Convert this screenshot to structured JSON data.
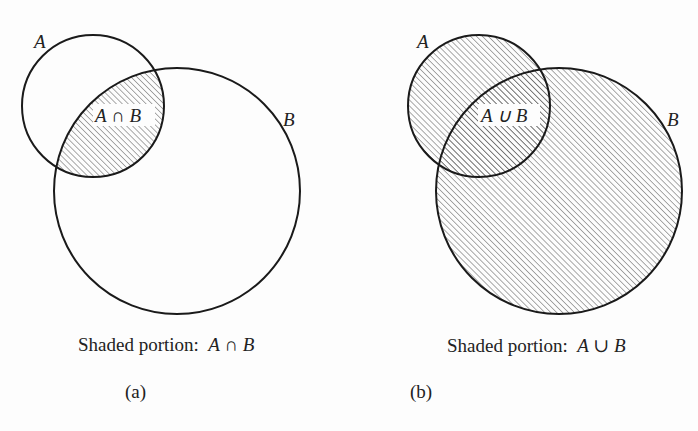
{
  "panels": [
    {
      "id": "a",
      "label": "(a)",
      "caption_text": "Shaded portion:",
      "caption_math": "A ∩ B",
      "set_a_label": "A",
      "set_b_label": "B",
      "region_label": "A ∩ B",
      "shaded_region": "intersection",
      "circle_a": {
        "cx": 93,
        "cy": 106,
        "r": 71
      },
      "circle_b": {
        "cx": 177,
        "cy": 191,
        "r": 123
      }
    },
    {
      "id": "b",
      "label": "(b)",
      "caption_text": "Shaded portion:",
      "caption_math": "A ∪ B",
      "set_a_label": "A",
      "set_b_label": "B",
      "region_label": "A ∪ B",
      "shaded_region": "union",
      "circle_a": {
        "cx": 479,
        "cy": 106,
        "r": 71
      },
      "circle_b": {
        "cx": 559,
        "cy": 191,
        "r": 123
      }
    }
  ],
  "colors": {
    "stroke": "#1a1a1a",
    "hatch": "#555555",
    "background": "#fdfdfd"
  }
}
